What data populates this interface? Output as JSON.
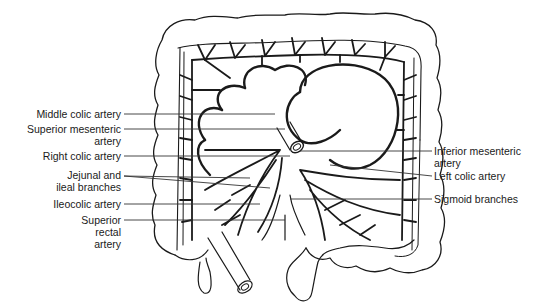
{
  "figure": {
    "labels_left": [
      {
        "id": "middle-colic",
        "lines": [
          "Middle colic artery"
        ]
      },
      {
        "id": "superior-mesenteric",
        "lines": [
          "Superior mesenteric",
          "artery"
        ]
      },
      {
        "id": "right-colic",
        "lines": [
          "Right colic artery"
        ]
      },
      {
        "id": "jejunal-ileal",
        "lines": [
          "Jejunal and",
          "ileal branches"
        ]
      },
      {
        "id": "ileocolic",
        "lines": [
          "Ileocolic artery"
        ]
      },
      {
        "id": "superior-rectal",
        "lines": [
          "Superior",
          "rectal",
          "artery"
        ]
      }
    ],
    "labels_right": [
      {
        "id": "inferior-mesenteric",
        "lines": [
          "Inferior mesenteric",
          "artery"
        ]
      },
      {
        "id": "left-colic",
        "lines": [
          "Left colic artery"
        ]
      },
      {
        "id": "sigmoid",
        "lines": [
          "Sigmoid branches"
        ]
      }
    ],
    "colors": {
      "ink": "#1a1a1a",
      "leader": "#333333",
      "background": "#ffffff"
    }
  }
}
